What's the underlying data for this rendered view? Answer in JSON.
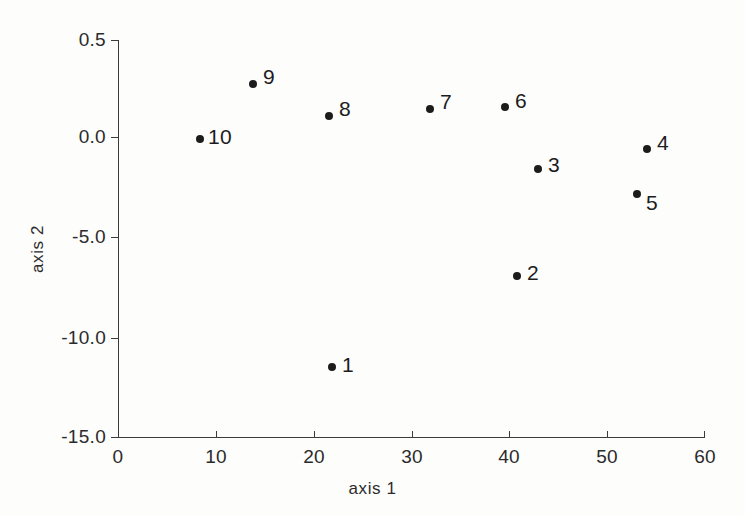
{
  "chart_data": {
    "type": "scatter",
    "title": "",
    "xlabel": "axis 1",
    "ylabel": "axis 2",
    "xlim": [
      0,
      60
    ],
    "ylim": [
      -15.0,
      0.5
    ],
    "grid": false,
    "legend": null,
    "x_ticks": [
      "0",
      "10",
      "20",
      "30",
      "40",
      "50",
      "60"
    ],
    "x_tick_values": [
      0,
      10,
      20,
      30,
      40,
      50,
      60
    ],
    "y_ticks": [
      "0.5",
      "0.0",
      "-5.0",
      "-10.0",
      "-15.0"
    ],
    "y_tick_values": [
      0.5,
      0.0,
      -5.0,
      -10.0,
      -15.0
    ],
    "y_axis_note": "tick labels are evenly spaced although value intervals are unequal",
    "marker_color": "#1c1c1c",
    "axis_color": "#3b3b3b",
    "points": [
      {
        "label": "1",
        "x": 21.8,
        "y": -11.5,
        "px": 332,
        "py": 367,
        "label_dx": 10,
        "label_dy": -2
      },
      {
        "label": "2",
        "x": 40.7,
        "y": -7.0,
        "px": 517,
        "py": 276,
        "label_dx": 10,
        "label_dy": -3
      },
      {
        "label": "3",
        "x": 42.9,
        "y": -1.6,
        "px": 538,
        "py": 169,
        "label_dx": 10,
        "label_dy": -4
      },
      {
        "label": "4",
        "x": 54.0,
        "y": -0.45,
        "px": 647,
        "py": 149,
        "label_dx": 10,
        "label_dy": -6
      },
      {
        "label": "5",
        "x": 53.0,
        "y": -2.8,
        "px": 637,
        "py": 194,
        "label_dx": 9,
        "label_dy": 9
      },
      {
        "label": "6",
        "x": 39.5,
        "y": 0.15,
        "px": 505,
        "py": 107,
        "label_dx": 10,
        "label_dy": -6
      },
      {
        "label": "7",
        "x": 31.8,
        "y": 0.14,
        "px": 430,
        "py": 109,
        "label_dx": 10,
        "label_dy": -7
      },
      {
        "label": "8",
        "x": 21.5,
        "y": 0.1,
        "px": 329,
        "py": 116,
        "label_dx": 10,
        "label_dy": -7
      },
      {
        "label": "9",
        "x": 13.8,
        "y": 0.27,
        "px": 253,
        "py": 84,
        "label_dx": 10,
        "label_dy": -7
      },
      {
        "label": "10",
        "x": 8.4,
        "y": -0.01,
        "px": 200,
        "py": 139,
        "label_dx": 8,
        "label_dy": -2
      }
    ]
  },
  "axis_geometry": {
    "x_tick_px": [
      118,
      216,
      314,
      412,
      509,
      607,
      705
    ],
    "y_tick_px": [
      40,
      137,
      237,
      338,
      437
    ]
  }
}
